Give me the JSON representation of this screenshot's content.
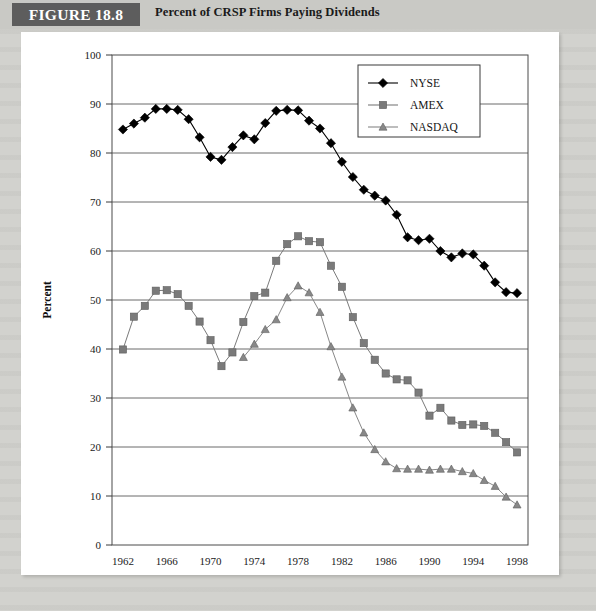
{
  "header": {
    "figure_tag": "FIGURE 18.8",
    "title": "Percent of CRSP Firms Paying Dividends"
  },
  "chart_data": {
    "type": "line",
    "title": "Percent of CRSP Firms Paying Dividends",
    "xlabel": "Year",
    "ylabel": "Percent",
    "xlim": [
      1961,
      1999
    ],
    "ylim": [
      0,
      100
    ],
    "ytick_step": 10,
    "yticks": [
      0,
      10,
      20,
      30,
      40,
      50,
      60,
      70,
      80,
      90,
      100
    ],
    "xticks": [
      1962,
      1966,
      1970,
      1974,
      1978,
      1982,
      1986,
      1990,
      1994,
      1998
    ],
    "grid": "horizontal",
    "legend_position": "top-right",
    "x": [
      1962,
      1963,
      1964,
      1965,
      1966,
      1967,
      1968,
      1969,
      1970,
      1971,
      1972,
      1973,
      1974,
      1975,
      1976,
      1977,
      1978,
      1979,
      1980,
      1981,
      1982,
      1983,
      1984,
      1985,
      1986,
      1987,
      1988,
      1989,
      1990,
      1991,
      1992,
      1993,
      1994,
      1995,
      1996,
      1997,
      1998
    ],
    "series": [
      {
        "name": "NYSE",
        "marker": "diamond",
        "color": "#000000",
        "values": [
          84.8,
          86.0,
          87.2,
          89.0,
          89.0,
          88.8,
          86.9,
          83.2,
          79.2,
          78.6,
          81.2,
          83.6,
          82.8,
          86.1,
          88.6,
          88.8,
          88.7,
          86.6,
          85.0,
          82.0,
          78.2,
          75.1,
          72.5,
          71.3,
          70.3,
          67.4,
          62.8,
          62.2,
          62.5,
          60.0,
          58.7,
          59.5,
          59.3,
          57.0,
          53.6,
          51.6,
          51.4
        ]
      },
      {
        "name": "AMEX",
        "marker": "square",
        "color": "#7a7a7a",
        "values": [
          39.9,
          46.6,
          48.8,
          51.9,
          52.0,
          51.2,
          48.8,
          45.6,
          41.8,
          36.5,
          39.3,
          45.5,
          50.8,
          51.5,
          58.0,
          61.4,
          63.0,
          62.0,
          61.8,
          57.0,
          52.7,
          46.5,
          41.2,
          37.8,
          35.0,
          33.8,
          33.6,
          31.1,
          26.4,
          28.0,
          25.4,
          24.5,
          24.6,
          24.3,
          22.9,
          21.0,
          18.9
        ]
      },
      {
        "name": "NASDAQ",
        "marker": "triangle",
        "color": "#888888",
        "values": [
          null,
          null,
          null,
          null,
          null,
          null,
          null,
          null,
          null,
          null,
          null,
          38.3,
          41.0,
          44.0,
          46.0,
          50.5,
          52.9,
          51.5,
          47.5,
          40.5,
          34.3,
          28.0,
          22.9,
          19.5,
          17.0,
          15.6,
          15.5,
          15.5,
          15.3,
          15.5,
          15.5,
          15.0,
          14.6,
          13.2,
          12.0,
          9.8,
          8.2
        ]
      }
    ]
  }
}
